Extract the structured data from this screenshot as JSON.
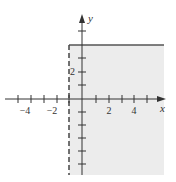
{
  "graph": {
    "description": "Shaded region x > -1 and y <= 4",
    "axes": {
      "x_label": "x",
      "y_label": "y",
      "x_tick_labels": [
        {
          "value": -4,
          "text": "−4"
        },
        {
          "value": -2,
          "text": "−2"
        },
        {
          "value": 2,
          "text": "2"
        },
        {
          "value": 4,
          "text": "4"
        }
      ],
      "y_tick_labels": [
        {
          "value": 2,
          "text": "2"
        }
      ],
      "x_range": [
        -5,
        6
      ],
      "y_range": [
        -6,
        6
      ]
    },
    "boundaries": [
      {
        "type": "vertical",
        "at": -1,
        "style": "dashed",
        "inequality": "x > -1"
      },
      {
        "type": "horizontal",
        "at": 4,
        "style": "solid",
        "inequality": "y <= 4"
      }
    ],
    "colors": {
      "shade": "#ececec",
      "line": "#555555",
      "axis": "#333333"
    }
  }
}
